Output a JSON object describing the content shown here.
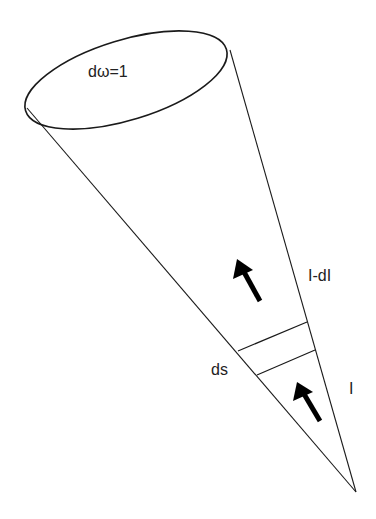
{
  "diagram": {
    "labels": {
      "solid_angle": "dω=1",
      "intensity_out": "I-dI",
      "intensity_in": "I",
      "path_element": "ds"
    },
    "colors": {
      "stroke": "#1a1a1a",
      "background": "#ffffff",
      "text": "#222222"
    },
    "geometry": {
      "ellipse": {
        "cx": 126,
        "cy": 80,
        "rx": 105,
        "ry": 40,
        "rotation": -17
      },
      "apex": [
        356,
        492
      ],
      "left_edge_start": [
        27,
        108
      ],
      "right_edge_start": [
        230,
        50
      ],
      "slab_upper": [
        [
          238,
          351
        ],
        [
          307,
          322
        ]
      ],
      "slab_lower": [
        [
          257,
          375
        ],
        [
          315,
          350
        ]
      ],
      "arrow_upper": {
        "tail": [
          260,
          301
        ],
        "tip": [
          237,
          259
        ]
      },
      "arrow_lower": {
        "tail": [
          320,
          421
        ],
        "tip": [
          297,
          382
        ]
      }
    }
  }
}
